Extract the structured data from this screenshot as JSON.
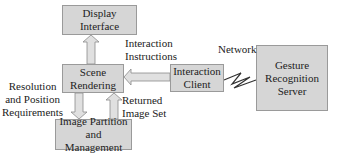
{
  "diagram": {
    "nodes": {
      "display": "Display\nInterface",
      "scene": "Scene\nRendering",
      "image": "Image Partition\nand Management",
      "client": "Interaction\nClient",
      "server": "Gesture\nRecognition\nServer"
    },
    "edge_labels": {
      "interaction_instructions": "Interaction\nInstructions",
      "network": "Network",
      "resolution": "Resolution\nand Position\nRequirements",
      "returned": "Returned\nImage Set"
    },
    "colors": {
      "box_fill": "#d6d6d6",
      "box_border": "#9a9a9a",
      "arrow_fill": "#e0e0e0",
      "arrow_stroke": "#8a8a8a",
      "text": "#222222"
    }
  }
}
